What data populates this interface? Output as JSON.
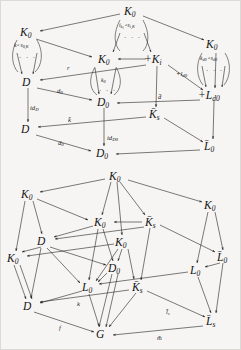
{
  "figure": {
    "kind": "commutative-diagram-pair",
    "background_color": "#f6f5f3",
    "ink_color": "#2b2b2b",
    "dots_glyph": "· · ·"
  },
  "diagram_top": {
    "name": "upper-cube-diagram",
    "nodes": [
      {
        "id": "t_K0_top",
        "label": "K",
        "sub": "0",
        "x": 131,
        "y": 11
      },
      {
        "id": "t_K0_left",
        "label": "K",
        "sub": "0",
        "x": 27,
        "y": 32
      },
      {
        "id": "t_K0_right",
        "label": "K",
        "sub": "0",
        "x": 213,
        "y": 44
      },
      {
        "id": "t_K0_mid",
        "label": "K",
        "sub": "0",
        "x": 105,
        "y": 59
      },
      {
        "id": "t_sumKi",
        "label": "+K",
        "sub": "i",
        "x": 158,
        "y": 59
      },
      {
        "id": "t_D_upper",
        "label": "D",
        "sub": "",
        "x": 28,
        "y": 82
      },
      {
        "id": "t_sumLd0",
        "label": "+L",
        "sub": "d0",
        "x": 212,
        "y": 95
      },
      {
        "id": "t_D0_upper",
        "label": "D",
        "sub": "0",
        "x": 104,
        "y": 102
      },
      {
        "id": "t_Kbar_s",
        "label": "K̄",
        "sub": "s",
        "x": 156,
        "y": 114
      },
      {
        "id": "t_D_lower",
        "label": "D",
        "sub": "",
        "x": 27,
        "y": 129
      },
      {
        "id": "t_Lbar0",
        "label": "L̄",
        "sub": "0",
        "x": 211,
        "y": 146
      },
      {
        "id": "t_D0_lower",
        "label": "D",
        "sub": "0",
        "x": 103,
        "y": 153
      }
    ],
    "edge_labels": [
      {
        "id": "t_r",
        "text": "r",
        "sub": "",
        "x": 69,
        "y": 68
      },
      {
        "id": "t_plusl",
        "text": "+l",
        "sub": "d0",
        "x": 182,
        "y": 74
      },
      {
        "id": "t_d0_a",
        "text": "d",
        "sub": "0",
        "x": 61,
        "y": 91
      },
      {
        "id": "t_dbar",
        "text": "d̄",
        "sub": "",
        "x": 162,
        "y": 97
      },
      {
        "id": "t_idD",
        "text": "id",
        "sub": "D",
        "x": 33,
        "y": 108
      },
      {
        "id": "t_kbar",
        "text": "k̄",
        "sub": "",
        "x": 71,
        "y": 120
      },
      {
        "id": "t_idD0",
        "text": "id",
        "sub": "D0",
        "x": 110,
        "y": 138
      },
      {
        "id": "t_d0_b",
        "text": "d",
        "sub": "0",
        "x": 62,
        "y": 143
      }
    ],
    "loop_labels": [
      {
        "id": "t_loop_left",
        "text": "k∘s",
        "sub": "0,K",
        "x": 26,
        "y": 45
      },
      {
        "id": "t_loop_mid",
        "text": "i",
        "sub": "k",
        "text2": "∘s",
        "sub2": "i,K",
        "x": 131,
        "y": 25
      },
      {
        "id": "t_loop_right",
        "text": "k",
        "sub": "d0",
        "text2": "∘s",
        "sub2": "d0",
        "x": 212,
        "y": 58
      },
      {
        "id": "t_loop_k0",
        "text": "k",
        "sub": "0",
        "x": 104,
        "y": 80
      }
    ]
  },
  "diagram_bottom": {
    "name": "lower-cube-diagram",
    "nodes": [
      {
        "id": "b_K0_top",
        "label": "K",
        "sub": "0",
        "x": 116,
        "y": 176
      },
      {
        "id": "b_K0_left",
        "label": "K",
        "sub": "0",
        "x": 28,
        "y": 194
      },
      {
        "id": "b_K0_right",
        "label": "K",
        "sub": "0",
        "x": 211,
        "y": 205
      },
      {
        "id": "b_K0_mid",
        "label": "K",
        "sub": "0",
        "x": 101,
        "y": 222
      },
      {
        "id": "b_Kbar_s_up",
        "label": "K̄",
        "sub": "s",
        "x": 152,
        "y": 222
      },
      {
        "id": "b_D_up",
        "label": "D",
        "sub": "",
        "x": 43,
        "y": 241
      },
      {
        "id": "b_K0_in",
        "label": "K",
        "sub": "0",
        "x": 122,
        "y": 242
      },
      {
        "id": "b_Lbar0",
        "label": "L̄",
        "sub": "0",
        "x": 224,
        "y": 257
      },
      {
        "id": "b_K0_farleft",
        "label": "K",
        "sub": "0",
        "x": 14,
        "y": 258
      },
      {
        "id": "b_D0",
        "label": "D",
        "sub": "0",
        "x": 115,
        "y": 268
      },
      {
        "id": "b_L0_right",
        "label": "L",
        "sub": "0",
        "x": 196,
        "y": 270
      },
      {
        "id": "b_L0_left",
        "label": "L",
        "sub": "0",
        "x": 88,
        "y": 287
      },
      {
        "id": "b_Kbar_s_lo",
        "label": "K̄",
        "sub": "s",
        "x": 139,
        "y": 287
      },
      {
        "id": "b_D_lo",
        "label": "D",
        "sub": "",
        "x": 29,
        "y": 306
      },
      {
        "id": "b_Lbar_s",
        "label": "L̄",
        "sub": "s",
        "x": 213,
        "y": 321
      },
      {
        "id": "b_G",
        "label": "G",
        "sub": "",
        "x": 102,
        "y": 334
      }
    ],
    "edge_labels": [
      {
        "id": "b_k",
        "text": "k",
        "sub": "",
        "x": 79,
        "y": 304
      },
      {
        "id": "b_f",
        "text": "f",
        "sub": "",
        "x": 61,
        "y": 328
      },
      {
        "id": "b_lbar_s",
        "text": "l̄",
        "sub": "s",
        "x": 170,
        "y": 312
      },
      {
        "id": "b_mbar",
        "text": "m̄",
        "sub": "",
        "x": 161,
        "y": 338
      }
    ]
  }
}
